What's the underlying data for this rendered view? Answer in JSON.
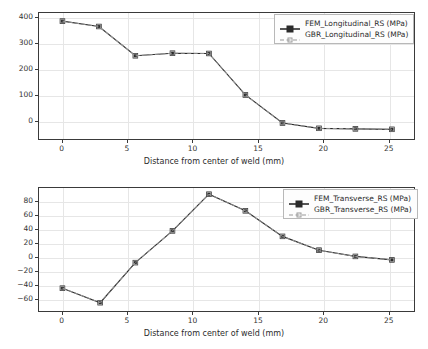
{
  "figure": {
    "background": "#ffffff",
    "panel_count": 2
  },
  "chart_data": [
    {
      "type": "line",
      "panel": "top",
      "title": "",
      "xlabel": "Distance from center of weld (mm)",
      "ylabel": "",
      "xlim": [
        -1.8,
        27.0
      ],
      "ylim": [
        -75,
        420
      ],
      "xticks": [
        0,
        5,
        10,
        15,
        20,
        25
      ],
      "yticks": [
        0,
        100,
        200,
        300,
        400
      ],
      "xtick_labels": [
        "0",
        "5",
        "10",
        "15",
        "20",
        "25"
      ],
      "ytick_labels": [
        "0",
        "100",
        "200",
        "300",
        "400"
      ],
      "grid": true,
      "legend_position": "upper right",
      "x": [
        0.0,
        2.8,
        5.6,
        8.45,
        11.25,
        14.05,
        16.9,
        19.7,
        22.5,
        25.3
      ],
      "series": [
        {
          "name": "FEM_Longitudinal_RS (MPa)",
          "color": "#2b2b2b",
          "linestyle": "solid",
          "marker": "square-filled",
          "values": [
            388,
            367,
            252,
            262,
            261,
            98,
            -12,
            -33,
            -35,
            -37
          ]
        },
        {
          "name": "GBR_Longitudinal_RS (MPa)",
          "color": "#9a9a9a",
          "linestyle": "dashed",
          "marker": "square-open",
          "values": [
            388,
            367,
            252,
            262,
            261,
            98,
            -12,
            -33,
            -35,
            -37
          ]
        }
      ]
    },
    {
      "type": "line",
      "panel": "bottom",
      "title": "",
      "xlabel": "Distance from center of weld (mm)",
      "ylabel": "",
      "xlim": [
        -1.8,
        27.0
      ],
      "ylim": [
        -78,
        100
      ],
      "xticks": [
        0,
        5,
        10,
        15,
        20,
        25
      ],
      "yticks": [
        -60,
        -40,
        -20,
        0,
        20,
        40,
        60,
        80
      ],
      "xtick_labels": [
        "0",
        "5",
        "10",
        "15",
        "20",
        "25"
      ],
      "ytick_labels": [
        "−60",
        "−40",
        "−20",
        "0",
        "20",
        "40",
        "60",
        "80"
      ],
      "grid": true,
      "legend_position": "upper right",
      "x": [
        0.0,
        2.9,
        5.6,
        8.45,
        11.25,
        14.05,
        16.9,
        19.7,
        22.5,
        25.3
      ],
      "series": [
        {
          "name": "FEM_Transverse_RS (MPa)",
          "color": "#2b2b2b",
          "linestyle": "solid",
          "marker": "square-filled",
          "values": [
            -45,
            -66,
            -8,
            38,
            91,
            67,
            30,
            10,
            1,
            -4
          ]
        },
        {
          "name": "GBR_Transverse_RS (MPa)",
          "color": "#9a9a9a",
          "linestyle": "dashed",
          "marker": "square-open",
          "values": [
            -45,
            -66,
            -8,
            38,
            91,
            67,
            30,
            10,
            1,
            -4
          ]
        }
      ]
    }
  ],
  "colors": {
    "fem_line": "#2b2b2b",
    "gbr_line": "#9a9a9a",
    "axis": "#3a3a3a",
    "grid": "#e6e6e6",
    "text": "#2b2b2b",
    "legend_border": "#b8b8b8",
    "legend_face": "#fdfdfd"
  }
}
